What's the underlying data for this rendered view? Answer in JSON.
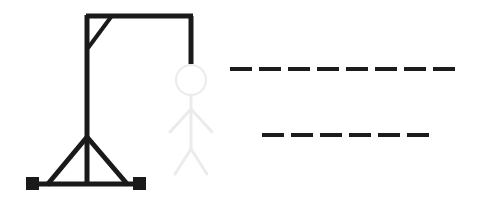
{
  "canvas": {
    "width": 491,
    "height": 197,
    "background_color": "#ffffff",
    "title": "Hangman"
  },
  "colors": {
    "gallows": "#1a1a1a",
    "blanks": "#1c1c1c",
    "figure_drawn": "#1a1a1a",
    "figure_faint": "#ebebeb",
    "background": "#ffffff"
  },
  "gallows": {
    "label": "gallows",
    "post": {
      "x": 87,
      "y_top": 15,
      "y_bottom": 186,
      "stroke": 5
    },
    "top_beam": {
      "x_left": 86,
      "x_right": 193,
      "y": 16,
      "stroke": 5
    },
    "brace": {
      "x1": 88,
      "y1": 48,
      "x2": 111,
      "y2": 17,
      "stroke": 4
    },
    "rope": {
      "x": 191,
      "y_top": 16,
      "y_bottom": 64,
      "stroke": 5
    },
    "base_bar": {
      "x_left": 28,
      "x_right": 146,
      "y": 184,
      "stroke": 5
    },
    "tripod": {
      "apex_x": 87,
      "apex_y": 137,
      "left_x": 47,
      "right_x": 128,
      "base_y": 185,
      "stroke": 5
    },
    "foot_left": {
      "x": 26,
      "y": 177,
      "size": 13
    },
    "foot_right": {
      "x": 133,
      "y": 177,
      "size": 13
    }
  },
  "figure": {
    "label": "hangman-stick-figure",
    "state": "faint-outline",
    "head": {
      "cx": 191,
      "cy": 80,
      "r": 15,
      "stroke": 2,
      "drawn": false
    },
    "body": {
      "x": 191,
      "y_top": 95,
      "y_bottom": 149,
      "stroke": 3,
      "drawn": false
    },
    "arm_left": {
      "x1": 191,
      "y1": 109,
      "x2": 170,
      "y2": 132,
      "stroke": 3,
      "drawn": false
    },
    "arm_right": {
      "x1": 191,
      "y1": 109,
      "x2": 212,
      "y2": 132,
      "stroke": 3,
      "drawn": false
    },
    "leg_left": {
      "x1": 191,
      "y1": 149,
      "x2": 175,
      "y2": 174,
      "stroke": 3,
      "drawn": false
    },
    "leg_right": {
      "x1": 191,
      "y1": 149,
      "x2": 207,
      "y2": 174,
      "stroke": 3,
      "drawn": false
    },
    "parts_drawn": 0,
    "parts_total": 6
  },
  "word_blanks": {
    "label": "word-blanks",
    "dash_width": 22,
    "dash_gap": 7,
    "dash_thickness": 4,
    "rows": [
      {
        "row_index": 0,
        "y": 67,
        "x_start": 230,
        "count": 8,
        "letters": [
          "",
          "",
          "",
          "",
          "",
          "",
          "",
          ""
        ]
      },
      {
        "row_index": 1,
        "y": 133,
        "x_start": 262,
        "count": 6,
        "letters": [
          "",
          "",
          "",
          "",
          "",
          ""
        ]
      }
    ],
    "total_blanks": 14,
    "revealed_letters": []
  }
}
